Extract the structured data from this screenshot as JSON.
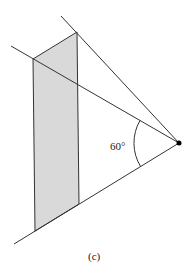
{
  "figure": {
    "angle_label": "60°",
    "caption": "(c)",
    "colors": {
      "line": "#333333",
      "shade": "#d9d9d9",
      "point": "#000000"
    },
    "apex": [
      179,
      143
    ],
    "rays": [
      {
        "name": "upper",
        "from": [
          61,
          16
        ]
      },
      {
        "name": "middle",
        "from": [
          11,
          46
        ]
      },
      {
        "name": "lower",
        "from": [
          14,
          244
        ]
      }
    ],
    "shaded_region": [
      [
        33,
        59
      ],
      [
        77,
        32
      ],
      [
        79,
        204
      ],
      [
        35,
        231
      ]
    ]
  }
}
